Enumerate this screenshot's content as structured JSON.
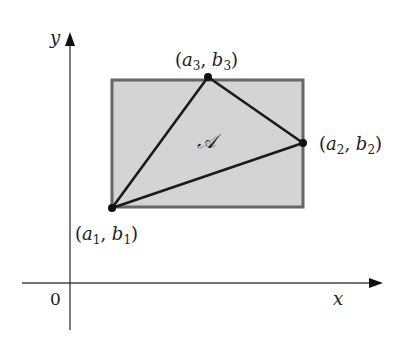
{
  "figure": {
    "axes": {
      "x_label": "x",
      "y_label": "y",
      "origin_label": "0"
    },
    "region_label": "𝒜",
    "rectangle": {
      "fill": "#d4d4d4",
      "stroke": "#666666"
    },
    "triangle": {
      "stroke": "#1a1a1a"
    },
    "vertices": [
      {
        "name": "a1b1",
        "a": "a",
        "a_sub": "1",
        "b": "b",
        "b_sub": "1"
      },
      {
        "name": "a2b2",
        "a": "a",
        "a_sub": "2",
        "b": "b",
        "b_sub": "2"
      },
      {
        "name": "a3b3",
        "a": "a",
        "a_sub": "3",
        "b": "b",
        "b_sub": "3"
      }
    ]
  }
}
